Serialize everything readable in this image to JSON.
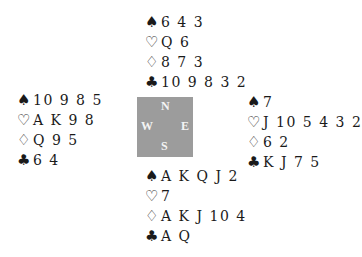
{
  "suit_symbols": {
    "spades": "♠",
    "hearts": "♡",
    "diamonds": "♢",
    "clubs": "♣"
  },
  "compass": {
    "north": "N",
    "south": "S",
    "west": "W",
    "east": "E",
    "color": "#9c9c9c"
  },
  "hands": {
    "north": {
      "spades": "6 4 3",
      "hearts": "Q 6",
      "diamonds": "8 7 3",
      "clubs": "10 9 8 3 2"
    },
    "west": {
      "spades": "10 9 8 5",
      "hearts": "A K 9 8",
      "diamonds": "Q 9 5",
      "clubs": "6 4"
    },
    "east": {
      "spades": "7",
      "hearts": "J 10 5 4 3 2",
      "diamonds": "6 2",
      "clubs": "K J 7 5"
    },
    "south": {
      "spades": "A K Q J 2",
      "hearts": "7",
      "diamonds": "A K J 10 4",
      "clubs": "A Q"
    }
  }
}
